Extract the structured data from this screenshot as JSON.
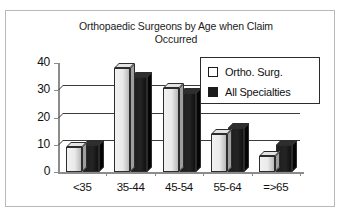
{
  "chart_data": {
    "type": "bar",
    "title": "Orthopaedic Surgeons by Age when Claim Occurred",
    "title_line1": "Orthopaedic Surgeons by Age when Claim",
    "title_line2": "Occurred",
    "xlabel": "",
    "ylabel": "",
    "categories": [
      "<35",
      "35-44",
      "45-54",
      "55-64",
      "=>65"
    ],
    "series": [
      {
        "name": "Ortho. Surg.",
        "values": [
          9,
          38,
          31,
          14,
          6
        ],
        "color": "#eaeaea"
      },
      {
        "name": "All Specialties",
        "values": [
          10,
          35,
          29,
          16,
          10
        ],
        "color": "#1b1b1b"
      }
    ],
    "ylim": [
      0,
      40
    ],
    "yticks": [
      0,
      10,
      20,
      30,
      40
    ],
    "ytick_labels": [
      "0",
      "10",
      "20",
      "30",
      "40"
    ],
    "grid": true,
    "legend_position": "upper-right",
    "style": "3d-clustered-column"
  },
  "legend": {
    "items": [
      {
        "label": "Ortho. Surg.",
        "swatch": "light-square-icon"
      },
      {
        "label": "All Specialties",
        "swatch": "dark-square-icon"
      }
    ]
  }
}
